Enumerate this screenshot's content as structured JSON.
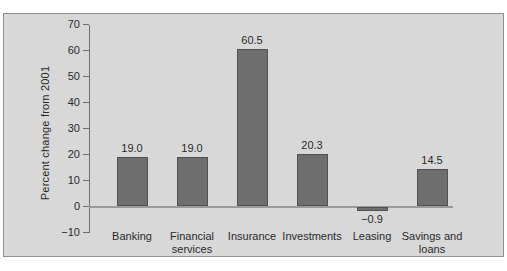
{
  "window": {
    "background": "#ffffff"
  },
  "chart": {
    "panel_background": "#d8d8d8",
    "panel_border_color": "#909090",
    "bar_fill": "#6e6e6e",
    "bar_border": "#525252",
    "axis_color": "#707070",
    "zero_line_color": "#9a9a9a",
    "text_color": "#2a2a2a"
  },
  "chart_data": {
    "type": "bar",
    "title": "",
    "xlabel": "",
    "ylabel": "Percent change from 2001",
    "categories": [
      "Banking",
      "Financial services",
      "Insurance",
      "Investments",
      "Leasing",
      "Savings and loans"
    ],
    "values": [
      19.0,
      19.0,
      60.5,
      20.3,
      -0.9,
      14.5
    ],
    "bar_value_labels": [
      "19.0",
      "19.0",
      "60.5",
      "20.3",
      "−0.9",
      "14.5"
    ],
    "yticks": [
      70,
      60,
      50,
      40,
      30,
      20,
      10,
      0,
      -10
    ],
    "ytick_labels": [
      "70",
      "60",
      "50",
      "40",
      "30",
      "20",
      "10",
      "0",
      "−10"
    ],
    "ylim": [
      -10,
      70
    ],
    "ytick_interval": 10,
    "grid": false,
    "legend": "none"
  }
}
